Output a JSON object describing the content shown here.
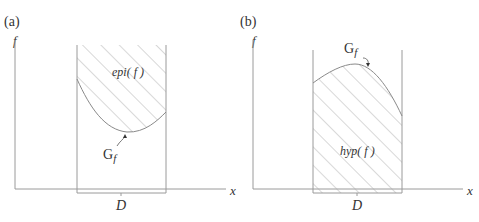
{
  "panel_a": {
    "tag": "(a)",
    "y_axis_label": "f",
    "x_axis_label": "x",
    "domain_label": "D",
    "region_label": "epi( f )",
    "graph_label_main": "G",
    "graph_label_sub": "f"
  },
  "panel_b": {
    "tag": "(b)",
    "y_axis_label": "f",
    "x_axis_label": "x",
    "domain_label": "D",
    "region_label": "hyp( f )",
    "graph_label_main": "G",
    "graph_label_sub": "f"
  },
  "colors": {
    "axis": "#9a9a9a",
    "curve": "#8a8a8a",
    "hatch": "#a8a8a8",
    "text": "#333333"
  }
}
